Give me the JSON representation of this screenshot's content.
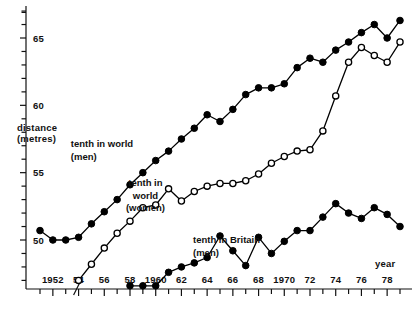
{
  "chart_data": {
    "type": "line",
    "title": "",
    "xlabel": "year",
    "ylabel": "distance (metres)",
    "xlim": [
      1951,
      1979
    ],
    "ylim": [
      46.5,
      67.5
    ],
    "grid": false,
    "legend_position": "inline-annotations",
    "x_tick_labels": [
      "1952",
      "54",
      "56",
      "58",
      "1960",
      "62",
      "64",
      "66",
      "68",
      "1970",
      "72",
      "74",
      "76",
      "78"
    ],
    "x_tick_values": [
      1952,
      1954,
      1956,
      1958,
      1960,
      1962,
      1964,
      1966,
      1968,
      1970,
      1972,
      1974,
      1976,
      1978
    ],
    "x_minor_tick_values": [
      1951,
      1953,
      1955,
      1957,
      1959,
      1961,
      1963,
      1965,
      1967,
      1969,
      1971,
      1973,
      1975,
      1977,
      1979
    ],
    "y_tick_labels": [
      "50",
      "55",
      "60",
      "65"
    ],
    "y_tick_values": [
      50,
      55,
      60,
      65
    ],
    "y_minor_tick_values": [
      47,
      48,
      49,
      51,
      52,
      53,
      54,
      56,
      57,
      58,
      59,
      61,
      62,
      63,
      64,
      66,
      67
    ],
    "axis_break_x": 1954,
    "series": [
      {
        "name": "tenth in world (men)",
        "marker": "filled-circle",
        "color": "#000000",
        "x": [
          1951,
          1952,
          1953,
          1954,
          1955,
          1956,
          1957,
          1958,
          1959,
          1960,
          1961,
          1962,
          1963,
          1964,
          1965,
          1966,
          1967,
          1968,
          1969,
          1970,
          1971,
          1972,
          1973,
          1974,
          1975,
          1976,
          1977,
          1978,
          1979
        ],
        "values": [
          50.7,
          50.0,
          50.0,
          50.2,
          51.2,
          52.1,
          53.0,
          54.1,
          55.0,
          55.9,
          56.6,
          57.5,
          58.3,
          59.3,
          58.8,
          59.7,
          60.8,
          61.3,
          61.3,
          61.6,
          62.8,
          63.5,
          63.2,
          64.1,
          64.7,
          65.4,
          66.0,
          65.0,
          66.3
        ]
      },
      {
        "name": "tenth in world (women)",
        "marker": "open-circle",
        "color": "#000000",
        "x": [
          1954,
          1955,
          1956,
          1957,
          1958,
          1959,
          1960,
          1961,
          1962,
          1963,
          1964,
          1965,
          1966,
          1967,
          1968,
          1969,
          1970,
          1971,
          1972,
          1973,
          1974,
          1975,
          1976,
          1977,
          1978,
          1979
        ],
        "values": [
          47.0,
          48.2,
          49.4,
          50.5,
          51.4,
          52.4,
          52.6,
          53.8,
          52.9,
          53.6,
          54.0,
          54.2,
          54.2,
          54.4,
          54.9,
          55.7,
          56.2,
          56.6,
          56.7,
          58.1,
          60.7,
          63.2,
          64.3,
          63.7,
          63.2,
          64.7
        ]
      },
      {
        "name": "tenth in Britain (men)",
        "marker": "filled-circle",
        "color": "#000000",
        "x": [
          1958,
          1959,
          1960,
          1961,
          1962,
          1963,
          1964,
          1965,
          1966,
          1967,
          1968,
          1969,
          1970,
          1971,
          1972,
          1973,
          1974,
          1975,
          1976,
          1977,
          1978,
          1979
        ],
        "values": [
          46.6,
          46.6,
          46.6,
          47.6,
          48.0,
          48.3,
          48.7,
          50.3,
          49.2,
          48.1,
          50.2,
          49.0,
          49.9,
          50.7,
          50.7,
          51.7,
          52.7,
          52.0,
          51.6,
          52.4,
          51.9,
          51.0
        ]
      }
    ],
    "annotations": [
      {
        "name": "world-men-label",
        "lines": [
          "tenth in world",
          "(men)"
        ],
        "x": 1953.4,
        "y": 57.1
      },
      {
        "name": "world-women-label",
        "lines": [
          "tenth in",
          "world",
          "(women)"
        ],
        "x": 1959.2,
        "y": 54.2
      },
      {
        "name": "britain-men-label",
        "lines": [
          "tenth in Britain",
          "(men)"
        ],
        "x": 1962.9,
        "y": 50.0
      }
    ]
  },
  "axis": {
    "y_title_line1": "distance",
    "y_title_line2": "(metres)",
    "x_title": "year"
  }
}
